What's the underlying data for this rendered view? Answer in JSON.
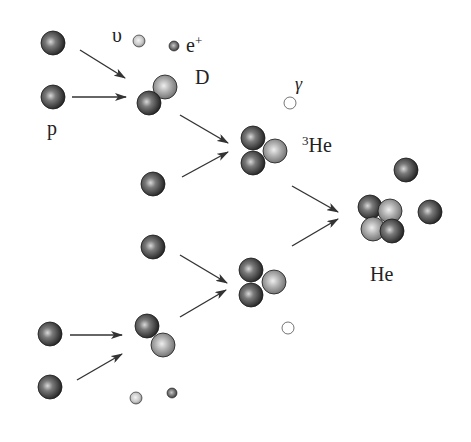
{
  "colors": {
    "proton": "#3a3a3a",
    "neutron": "#9a9a9a",
    "arrow": "#333333",
    "background": "#ffffff"
  },
  "labels": {
    "proton": "p",
    "neutrino": "υ",
    "positron_base": "e",
    "positron_sup": "+",
    "deuteron": "D",
    "gamma": "γ",
    "helium3_sup": "3",
    "helium3_base": "He",
    "helium4": "He"
  },
  "particles": [
    {
      "type": "proton",
      "x": 53,
      "y": 43,
      "r": 12
    },
    {
      "type": "proton",
      "x": 53,
      "y": 97,
      "r": 12
    },
    {
      "type": "neutrino",
      "x": 139,
      "y": 41,
      "r": 6
    },
    {
      "type": "positron",
      "x": 174,
      "y": 46,
      "r": 5
    },
    {
      "type": "neutron",
      "x": 165,
      "y": 87,
      "r": 12
    },
    {
      "type": "proton",
      "x": 149,
      "y": 103,
      "r": 12
    },
    {
      "type": "gamma",
      "x": 290,
      "y": 103,
      "r": 6
    },
    {
      "type": "proton",
      "x": 253,
      "y": 138,
      "r": 12
    },
    {
      "type": "proton",
      "x": 253,
      "y": 163,
      "r": 12
    },
    {
      "type": "neutron",
      "x": 275,
      "y": 151,
      "r": 12
    },
    {
      "type": "proton",
      "x": 153,
      "y": 184,
      "r": 12
    },
    {
      "type": "proton",
      "x": 153,
      "y": 247,
      "r": 12
    },
    {
      "type": "proton",
      "x": 251,
      "y": 270,
      "r": 12
    },
    {
      "type": "proton",
      "x": 251,
      "y": 295,
      "r": 12
    },
    {
      "type": "neutron",
      "x": 274,
      "y": 282,
      "r": 12
    },
    {
      "type": "gamma",
      "x": 288,
      "y": 328,
      "r": 6
    },
    {
      "type": "proton",
      "x": 147,
      "y": 326,
      "r": 12
    },
    {
      "type": "neutron",
      "x": 163,
      "y": 345,
      "r": 12
    },
    {
      "type": "proton",
      "x": 50,
      "y": 334,
      "r": 12
    },
    {
      "type": "proton",
      "x": 50,
      "y": 387,
      "r": 12
    },
    {
      "type": "neutrino",
      "x": 136,
      "y": 398,
      "r": 6
    },
    {
      "type": "positron",
      "x": 172,
      "y": 393,
      "r": 5
    },
    {
      "type": "proton",
      "x": 406,
      "y": 170,
      "r": 12
    },
    {
      "type": "proton",
      "x": 370,
      "y": 207,
      "r": 12
    },
    {
      "type": "neutron",
      "x": 390,
      "y": 211,
      "r": 12
    },
    {
      "type": "neutron",
      "x": 373,
      "y": 229,
      "r": 12
    },
    {
      "type": "proton",
      "x": 392,
      "y": 231,
      "r": 12
    },
    {
      "type": "proton",
      "x": 430,
      "y": 212,
      "r": 12
    }
  ],
  "arrows": [
    {
      "x1": 80,
      "y1": 50,
      "x2": 125,
      "y2": 78
    },
    {
      "x1": 72,
      "y1": 97,
      "x2": 126,
      "y2": 97
    },
    {
      "x1": 180,
      "y1": 115,
      "x2": 228,
      "y2": 143
    },
    {
      "x1": 182,
      "y1": 177,
      "x2": 228,
      "y2": 152
    },
    {
      "x1": 180,
      "y1": 255,
      "x2": 227,
      "y2": 283
    },
    {
      "x1": 180,
      "y1": 317,
      "x2": 226,
      "y2": 290
    },
    {
      "x1": 70,
      "y1": 335,
      "x2": 122,
      "y2": 335
    },
    {
      "x1": 77,
      "y1": 380,
      "x2": 122,
      "y2": 354
    },
    {
      "x1": 292,
      "y1": 186,
      "x2": 338,
      "y2": 212
    },
    {
      "x1": 292,
      "y1": 246,
      "x2": 338,
      "y2": 219
    }
  ]
}
